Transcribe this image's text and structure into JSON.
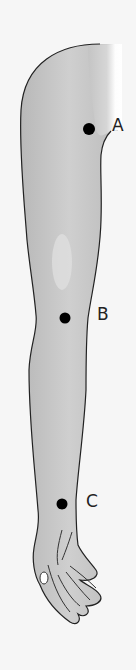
{
  "diagram": {
    "colors": {
      "background": "#f6f6f6",
      "skin": "#c4c4c4",
      "highlight": "#ffffff",
      "outline": "#222222",
      "point": "#000000"
    },
    "points": [
      {
        "id": "A",
        "label": "A",
        "x": 89,
        "y": 129,
        "label_x": 112,
        "label_y": 117
      },
      {
        "id": "B",
        "label": "B",
        "x": 65,
        "y": 318,
        "label_x": 97,
        "label_y": 306
      },
      {
        "id": "C",
        "label": "C",
        "x": 62,
        "y": 504,
        "label_x": 86,
        "label_y": 493
      }
    ]
  }
}
